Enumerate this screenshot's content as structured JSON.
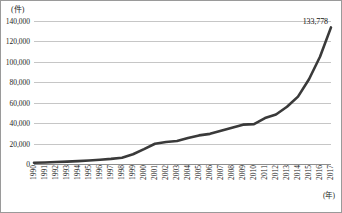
{
  "chart_data": {
    "type": "line",
    "title": "",
    "subtitle": "",
    "xlabel": "(年)",
    "ylabel": "(件)",
    "xlim": [
      1990,
      2017
    ],
    "ylim": [
      0,
      140000
    ],
    "grid": true,
    "legend": false,
    "y_tick_labels": [
      "140,000",
      "120,000",
      "100,000",
      "80,000",
      "60,000",
      "40,000",
      "20,000",
      "0"
    ],
    "y_tick_values": [
      140000,
      120000,
      100000,
      80000,
      60000,
      40000,
      20000,
      0
    ],
    "categories": [
      "1990",
      "1991",
      "1992",
      "1993",
      "1994",
      "1995",
      "1996",
      "1997",
      "1998",
      "1999",
      "2000",
      "2001",
      "2002",
      "2003",
      "2004",
      "2005",
      "2006",
      "2007",
      "2008",
      "2009",
      "2010",
      "2011",
      "2012",
      "2013",
      "2014",
      "2015",
      "2016",
      "2017"
    ],
    "values": [
      1200,
      1500,
      1900,
      2300,
      2800,
      3400,
      4200,
      5000,
      6200,
      9500,
      14500,
      19800,
      21500,
      22500,
      25500,
      28000,
      29500,
      32500,
      35500,
      38500,
      39000,
      45000,
      48500,
      56000,
      66000,
      83000,
      105000,
      133778
    ],
    "series_name": "件数",
    "line_color": "#3a3a3a",
    "grid_color": "#c6c6c6",
    "axis_color": "#8e8e8e",
    "annotations": [
      {
        "label": "133,778",
        "x": "2017",
        "y": 133778
      }
    ]
  }
}
